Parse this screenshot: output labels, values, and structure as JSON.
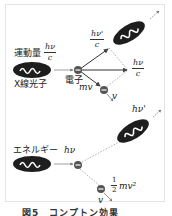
{
  "figure": {
    "caption": "図5　コンプトン効果",
    "colors": {
      "photon_fill": "#1e1e1e",
      "wave_stroke": "#ffffff",
      "arrow_color": "#555555",
      "dotted_color": "#888888",
      "electron_fill": "#555555",
      "frame_border": "#e4e4e4"
    }
  },
  "momentum_diagram": {
    "label_prefix": "運動量",
    "incident_momentum": {
      "numerator": "hν",
      "denominator": "c"
    },
    "photon_label": "X線光子",
    "electron_label": "電子",
    "scattered_momentum": {
      "numerator": "hν'",
      "denominator": "c"
    },
    "resultant_momentum": {
      "numerator": "hν",
      "denominator": "c"
    },
    "electron_momentum": "mv",
    "electron_velocity": "v"
  },
  "energy_diagram": {
    "label_prefix": "エネルギー",
    "incident_energy": "hν",
    "scattered_energy": "hν'",
    "kinetic_energy": {
      "numerator": "1",
      "denominator": "2",
      "suffix": "mv²"
    },
    "electron_velocity": "v"
  }
}
